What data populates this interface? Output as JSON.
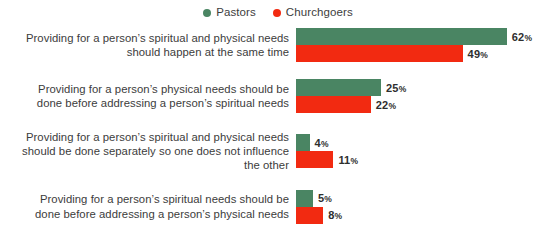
{
  "legend": {
    "position": "top-center",
    "items": [
      {
        "label": "Pastors",
        "color": "#4a8563",
        "icon": "circle-marker"
      },
      {
        "label": "Churchgoers",
        "color": "#f22a11",
        "icon": "circle-marker"
      }
    ]
  },
  "chart_data": {
    "type": "bar",
    "orientation": "horizontal",
    "title": "",
    "subtitle": "",
    "xlabel": "",
    "ylabel": "",
    "xlim": [
      0,
      62
    ],
    "grid": false,
    "value_suffix": "%",
    "legend_position": "top-center",
    "categories": [
      "Providing for a person’s spiritual and physical needs should happen at the same time",
      "Providing for a person’s physical needs should be done before addressing a person’s spiritual needs",
      "Providing for a person’s spiritual and physical needs should be done separately so one does not influence the other",
      "Providing for a person’s spiritual needs should be done before addressing a person’s physical needs"
    ],
    "category_lines": [
      [
        "Providing for a person’s spiritual and physical needs",
        "should happen at the same time"
      ],
      [
        "Providing for a person’s physical needs should be",
        "done before addressing a person’s spiritual needs"
      ],
      [
        "Providing for a person’s spiritual and physical needs",
        "should be done separately so one does not influence",
        "the other"
      ],
      [
        "Providing for a person’s spiritual needs should be",
        "done before addressing a person’s physical needs"
      ]
    ],
    "series": [
      {
        "name": "Pastors",
        "color": "#4a8563",
        "values": [
          62,
          25,
          4,
          5
        ]
      },
      {
        "name": "Churchgoers",
        "color": "#f22a11",
        "values": [
          49,
          22,
          11,
          8
        ]
      }
    ],
    "data_labels": [
      [
        "62%",
        "49%"
      ],
      [
        "25%",
        "22%"
      ],
      [
        "4%",
        "11%"
      ],
      [
        "5%",
        "8%"
      ]
    ]
  }
}
